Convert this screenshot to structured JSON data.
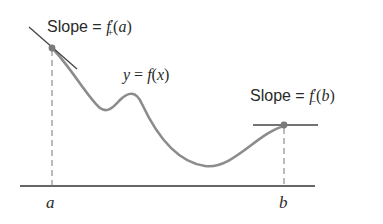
{
  "figure": {
    "labels": {
      "slope_a_prefix": "Slope = ",
      "slope_a_f": "f",
      "slope_a_prime": "′",
      "slope_a_sub": "+",
      "slope_a_arg_open": "(",
      "slope_a_arg": "a",
      "slope_a_arg_close": ")",
      "curve_y": "y",
      "curve_eq": " = ",
      "curve_f": "f",
      "curve_open": "(",
      "curve_x": "x",
      "curve_close": ")",
      "slope_b_prefix": "Slope = ",
      "slope_b_f": "f",
      "slope_b_prime": "′",
      "slope_b_sub": "−",
      "slope_b_arg_open": "(",
      "slope_b_arg": "b",
      "slope_b_arg_close": ")",
      "axis_a": "a",
      "axis_b": "b"
    },
    "colors": {
      "curve": "#8c8c8c",
      "axis": "#333333",
      "tangent": "#444444",
      "point": "#7a7a7a",
      "dashed": "#777777",
      "text": "#2a2a2a"
    },
    "points": {
      "a": {
        "x": 52,
        "y": 48
      },
      "b": {
        "x": 284,
        "y": 126
      }
    }
  }
}
